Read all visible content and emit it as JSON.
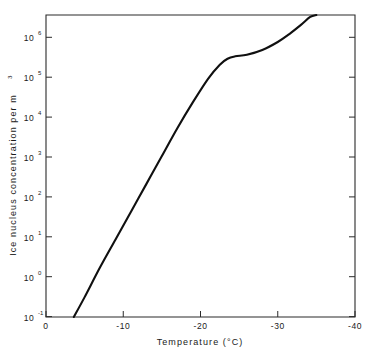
{
  "chart_data": {
    "type": "line",
    "title": "",
    "xlabel": "Temperature  (°C)",
    "ylabel": "Ice nucleus concentration per m",
    "ylabel_exponent": "3",
    "xlim": [
      0,
      -40
    ],
    "ylim": [
      -1,
      6.6
    ],
    "y_scale": "log",
    "x_scale": "linear",
    "grid": false,
    "legend": null,
    "x_ticks": [
      "0",
      "-10",
      "-20",
      "-30",
      "-40"
    ],
    "x_tick_values": [
      0,
      -10,
      -20,
      -30,
      -40
    ],
    "y_ticks": [
      {
        "mantissa": "10",
        "exponent": "6",
        "value": 1000000
      },
      {
        "mantissa": "10",
        "exponent": "5",
        "value": 100000
      },
      {
        "mantissa": "10",
        "exponent": "4",
        "value": 10000
      },
      {
        "mantissa": "10",
        "exponent": "3",
        "value": 1000
      },
      {
        "mantissa": "10",
        "exponent": "2",
        "value": 100
      },
      {
        "mantissa": "10",
        "exponent": "1",
        "value": 10
      },
      {
        "mantissa": "10",
        "exponent": "0",
        "value": 1
      },
      {
        "mantissa": "10",
        "exponent": "-1",
        "value": 0.1
      }
    ],
    "series": [
      {
        "name": "ice nucleus concentration",
        "points": [
          [
            -3.6,
            -1.0
          ],
          [
            -5.0,
            -0.5
          ],
          [
            -7.0,
            0.25
          ],
          [
            -9.0,
            0.95
          ],
          [
            -11.0,
            1.65
          ],
          [
            -13.0,
            2.35
          ],
          [
            -15.0,
            3.05
          ],
          [
            -17.0,
            3.75
          ],
          [
            -19.0,
            4.4
          ],
          [
            -21.0,
            5.0
          ],
          [
            -22.5,
            5.35
          ],
          [
            -23.5,
            5.5
          ],
          [
            -24.5,
            5.56
          ],
          [
            -26.0,
            5.6
          ],
          [
            -28.0,
            5.72
          ],
          [
            -30.0,
            5.92
          ],
          [
            -31.5,
            6.12
          ],
          [
            -33.0,
            6.35
          ],
          [
            -34.2,
            6.55
          ],
          [
            -35.0,
            6.6
          ]
        ]
      }
    ]
  },
  "figure": {
    "background_color": "#ffffff",
    "axis_color": "#2b2b2b",
    "curve_color": "#101010"
  }
}
